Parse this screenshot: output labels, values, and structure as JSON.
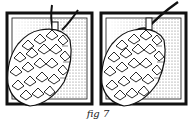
{
  "figure": {
    "caption": "fig 7",
    "panels": [
      {
        "id": "left",
        "subject": "pinecone hanging on string",
        "string_angle": "upward-left"
      },
      {
        "id": "right",
        "subject": "pinecone hanging on string",
        "string_angle": "upward-right"
      }
    ],
    "colors": {
      "ink": "#111111",
      "paper": "#ffffff",
      "hatch": "#9a9a9a"
    }
  }
}
